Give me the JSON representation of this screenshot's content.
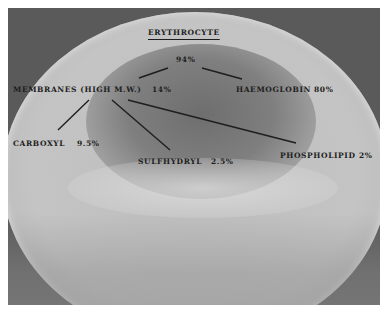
{
  "diagram": {
    "title": "ERYTHROCYTE",
    "root": {
      "label": "94%"
    },
    "branches": [
      {
        "label": "MEMBRANES (HIGH M.W.)",
        "value": "14%",
        "children": [
          {
            "label": "CARBOXYL",
            "value": "9.5%"
          },
          {
            "label": "SULFHYDRYL",
            "value": "2.5%"
          },
          {
            "label": "PHOSPHOLIPID",
            "value": "2%"
          }
        ]
      },
      {
        "label": "HAEMOGLOBIN",
        "value": "80%"
      }
    ]
  },
  "colors": {
    "background_corners": "#5a5a5a",
    "cell": "#c4c4c4",
    "center": "#6e6e6e",
    "text": "#1e1e1e"
  }
}
